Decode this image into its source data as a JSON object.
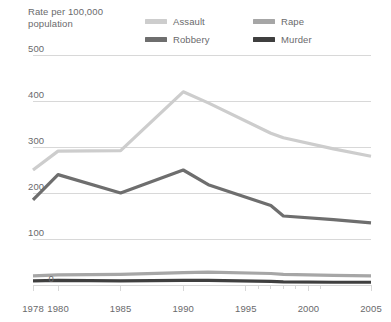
{
  "chart_data": {
    "type": "line",
    "title": "",
    "ylabel": "Rate per 100,000 population",
    "xlabel": "",
    "ylim": [
      0,
      500
    ],
    "xlim": [
      1978,
      2005
    ],
    "grid": true,
    "legend_position": "top-right",
    "yticks": [
      0,
      100,
      200,
      300,
      400,
      500
    ],
    "ytick_labels": [
      "0",
      "100",
      "200",
      "300",
      "400",
      "500"
    ],
    "xticks": [
      1978,
      1980,
      1985,
      1990,
      1995,
      2000,
      2005
    ],
    "xtick_labels": [
      "1978",
      "1980",
      "1985",
      "1990",
      "1995",
      "2000",
      "2005"
    ],
    "minor_xticks": [
      1996,
      1997,
      1998,
      1999,
      2001
    ],
    "series": [
      {
        "name": "Assault",
        "color": "#cdcdcd",
        "x": [
          1978,
          1980,
          1985,
          1990,
          1992,
          1997,
          1998,
          2002,
          2005
        ],
        "values": [
          250,
          291,
          292,
          420,
          396,
          330,
          320,
          296,
          280
        ]
      },
      {
        "name": "Rape",
        "color": "#a6a6a6",
        "x": [
          1978,
          1980,
          1985,
          1990,
          1992,
          1997,
          1998,
          2002,
          2005
        ],
        "values": [
          20,
          22,
          23,
          27,
          28,
          25,
          23,
          21,
          20
        ]
      },
      {
        "name": "Robbery",
        "color": "#6e6e6e",
        "x": [
          1978,
          1980,
          1985,
          1990,
          1992,
          1997,
          1998,
          2002,
          2005
        ],
        "values": [
          185,
          240,
          200,
          250,
          218,
          173,
          150,
          142,
          135
        ]
      },
      {
        "name": "Murder",
        "color": "#3f3f3f",
        "x": [
          1978,
          1980,
          1985,
          1990,
          1992,
          1997,
          1998,
          2002,
          2005
        ],
        "values": [
          9,
          10,
          9,
          10,
          10,
          8,
          7,
          6,
          6
        ]
      }
    ]
  },
  "legend": {
    "items": [
      {
        "label": "Assault",
        "color": "#cdcdcd"
      },
      {
        "label": "Rape",
        "color": "#a6a6a6"
      },
      {
        "label": "Robbery",
        "color": "#6e6e6e"
      },
      {
        "label": "Murder",
        "color": "#3f3f3f"
      }
    ]
  },
  "axis": {
    "y_title_line1": "Rate per 100,000",
    "y_title_line2": "population"
  },
  "colors": {
    "grid": "#d8d8d8",
    "text": "#6a6a6c",
    "background": "#ffffff"
  }
}
